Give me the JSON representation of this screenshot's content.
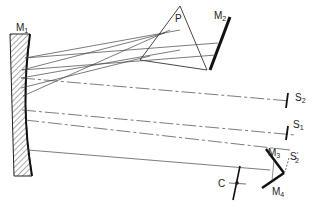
{
  "diagram": {
    "type": "optical-schematic",
    "labels": {
      "m1": "M",
      "m1_sub": "1",
      "m2": "M",
      "m2_sub": "2",
      "prism": "P",
      "m3": "M",
      "m3_sub": "3",
      "m4": "M",
      "m4_sub": "4",
      "s2": "S",
      "s2_sub": "2",
      "s1": "S",
      "s1_sub": "1",
      "s2prime": "S",
      "s2prime_sub": "2",
      "s2prime_mark": "′",
      "c": "C"
    },
    "colors": {
      "ink": "#222222",
      "ray": "#444444",
      "hatch": "#555555"
    }
  }
}
